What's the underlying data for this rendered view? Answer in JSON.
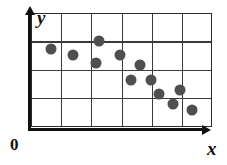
{
  "figure": {
    "type": "scatter-plot",
    "origin_label": "0",
    "x_axis_label": "x",
    "y_axis_label": "y",
    "dot_color": "#4f4f4f",
    "axis_color": "#111111",
    "grid_color": "#3a3a3a",
    "background_color": "#ffffff"
  },
  "chart_data": {
    "type": "scatter",
    "title": "",
    "xlabel": "x",
    "ylabel": "y",
    "grid": true,
    "legend": false,
    "xlim": [
      0,
      6
    ],
    "ylim": [
      0,
      4
    ],
    "x_gridlines": [
      1,
      2,
      3,
      4,
      5
    ],
    "y_gridlines": [
      1,
      2,
      3
    ],
    "tick_labels": [],
    "annotations": [
      "0"
    ],
    "trend": "negative",
    "series": [
      {
        "name": "data",
        "points": [
          {
            "x": 0.62,
            "y": 2.77
          },
          {
            "x": 1.37,
            "y": 2.57
          },
          {
            "x": 2.23,
            "y": 3.07
          },
          {
            "x": 2.12,
            "y": 2.29
          },
          {
            "x": 2.92,
            "y": 2.55
          },
          {
            "x": 3.57,
            "y": 2.22
          },
          {
            "x": 3.27,
            "y": 1.7
          },
          {
            "x": 3.93,
            "y": 1.7
          },
          {
            "x": 4.22,
            "y": 1.18
          },
          {
            "x": 4.9,
            "y": 1.33
          },
          {
            "x": 4.67,
            "y": 0.83
          },
          {
            "x": 5.3,
            "y": 0.62
          }
        ]
      }
    ]
  }
}
